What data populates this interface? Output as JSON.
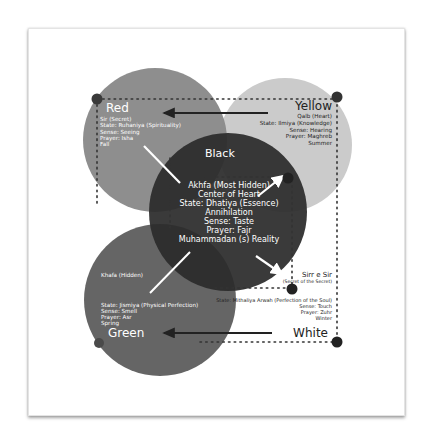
{
  "colors": {
    "red_circle": "#8a8a8a",
    "yellow_circle": "#cbcbcb",
    "green_circle": "#5f5f5f",
    "black_circle": "#2b2b2b",
    "white_circle": "#ffffff",
    "node_dot": "#333333",
    "arrow_dark": "#222222",
    "arrow_light": "#ffffff"
  },
  "red": {
    "title": "Red",
    "lines": [
      "Sir (Secret)",
      "State: Ruhaniya (Spirituality)",
      "Sense: Seeing",
      "Prayer: Isha",
      "Fall"
    ]
  },
  "yellow": {
    "title": "Yellow",
    "lines": [
      "Qalb (Heart)",
      "State: Ilmiya (Knowledge)",
      "Sense: Hearing",
      "Prayer: Maghreb",
      "Summer"
    ]
  },
  "black": {
    "title": "Black",
    "lines": [
      "Akhfa (Most Hidden)",
      "Center of Heart",
      "State: Dhatiya (Essence)",
      "Annihilation",
      "Sense: Taste",
      "Prayer: Fajr",
      "Muhammadan (s) Reality"
    ]
  },
  "green": {
    "title": "Green",
    "name": "Khafa (Hidden)",
    "lines": [
      "State: Jismiya (Physical Perfection)",
      "Sense: Smell",
      "Prayer: Asr",
      "Spring"
    ]
  },
  "white": {
    "title": "White",
    "name": "Sirr e Sir",
    "subname": "(Secret of the Secret)",
    "lines": [
      "State: Mithaliya Arwah (Perfection of the Soul)",
      "Sense: Touch",
      "Prayer: Zuhr",
      "Winter"
    ]
  }
}
